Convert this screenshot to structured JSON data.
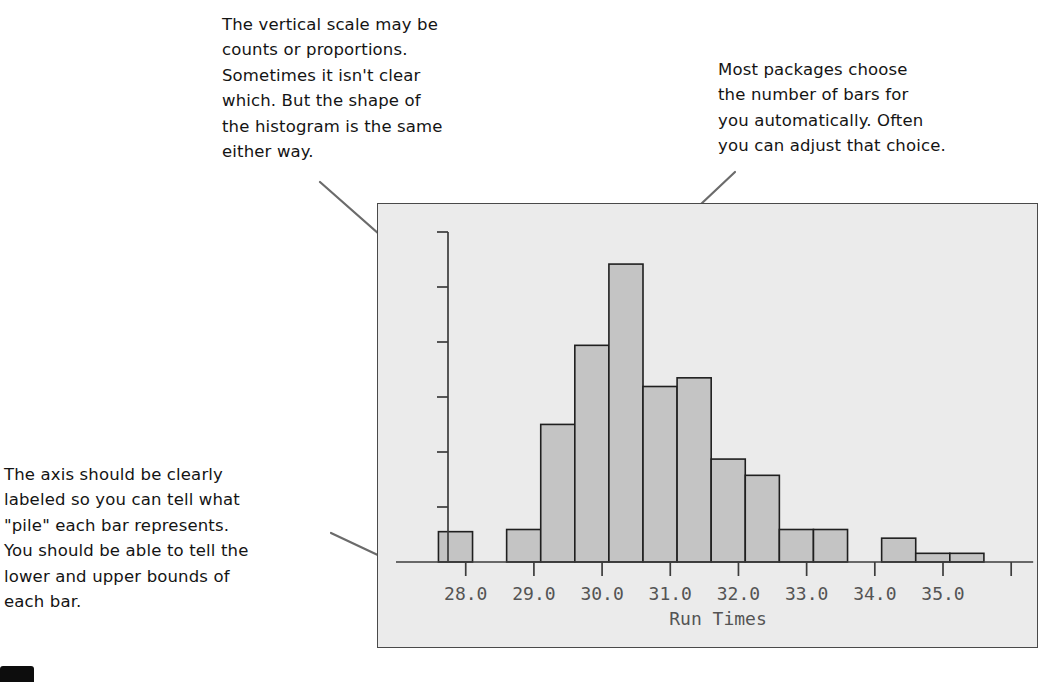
{
  "figure": {
    "kind": "annotated-histogram-figure",
    "background_color": "#ffffff",
    "plot_background_color": "#ebebeb",
    "frame_border_color": "#4a4a4a",
    "bar_fill_color": "#c4c4c4",
    "bar_edge_color": "#1f1f1f",
    "axis_color": "#3c3c3c",
    "tick_label_color": "#545454",
    "annotation_text_color": "#141414",
    "leader_line_color": "#6b6b6b"
  },
  "annotations": [
    {
      "id": "note-vertical-scale",
      "lines": [
        "The vertical scale may be",
        "counts or proportions.",
        "Sometimes it isn't clear",
        "which. But the shape of",
        "the histogram is the same",
        "either way."
      ],
      "points_to": "y-axis"
    },
    {
      "id": "note-bar-count",
      "lines": [
        "Most packages choose",
        "the number of bars for",
        "you automatically. Often",
        "you can adjust that choice."
      ],
      "points_to": "tallest-bar"
    },
    {
      "id": "note-axis-label",
      "lines": [
        "The axis should be clearly",
        "labeled so you can tell what",
        "\"pile\" each bar represents.",
        "You should be able to tell the",
        "lower and upper bounds of",
        "each bar."
      ],
      "points_to": "x-axis"
    }
  ],
  "chart_data": {
    "type": "bar",
    "subtype": "histogram",
    "title": "",
    "xlabel": "Run Times",
    "ylabel": "",
    "grid": false,
    "legend": false,
    "xlim": [
      27.3,
      36.1
    ],
    "ylim": [
      0,
      300
    ],
    "bin_width": 0.5,
    "xtick_labels": [
      "28.0",
      "29.0",
      "30.0",
      "31.0",
      "32.0",
      "33.0",
      "34.0",
      "35.0"
    ],
    "xtick_values": [
      28.0,
      29.0,
      30.0,
      31.0,
      32.0,
      33.0,
      34.0,
      35.0
    ],
    "extra_xtick_values": [
      36.0
    ],
    "ytick_labels": [],
    "ytick_count": 6,
    "bins": [
      {
        "lower": 27.6,
        "upper": 28.1,
        "height": 28
      },
      {
        "lower": 28.1,
        "upper": 28.6,
        "height": 0
      },
      {
        "lower": 28.6,
        "upper": 29.1,
        "height": 30
      },
      {
        "lower": 29.1,
        "upper": 29.6,
        "height": 127
      },
      {
        "lower": 29.6,
        "upper": 30.1,
        "height": 200
      },
      {
        "lower": 30.1,
        "upper": 30.6,
        "height": 275
      },
      {
        "lower": 30.6,
        "upper": 31.1,
        "height": 162
      },
      {
        "lower": 31.1,
        "upper": 31.6,
        "height": 170
      },
      {
        "lower": 31.6,
        "upper": 32.1,
        "height": 95
      },
      {
        "lower": 32.1,
        "upper": 32.6,
        "height": 80
      },
      {
        "lower": 32.6,
        "upper": 33.1,
        "height": 30
      },
      {
        "lower": 33.1,
        "upper": 33.6,
        "height": 30
      },
      {
        "lower": 33.6,
        "upper": 34.1,
        "height": 0
      },
      {
        "lower": 34.1,
        "upper": 34.6,
        "height": 22
      },
      {
        "lower": 34.6,
        "upper": 35.1,
        "height": 8
      },
      {
        "lower": 35.1,
        "upper": 35.6,
        "height": 8
      }
    ]
  }
}
